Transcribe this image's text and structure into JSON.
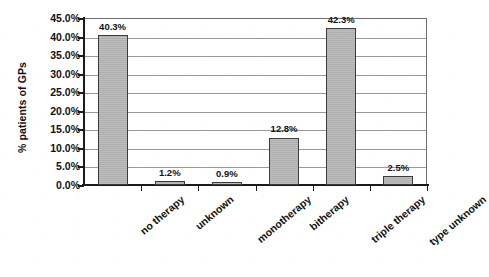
{
  "chart_data": {
    "type": "bar",
    "title": "",
    "xlabel": "",
    "ylabel": "% patients of GPs",
    "ylim": [
      0,
      45
    ],
    "ytick_step": 5,
    "grid": "horizontal",
    "legend": "none",
    "categories": [
      "no therapy",
      "unknown",
      "monotherapy",
      "bitherapy",
      "triple therapy",
      "type unknown"
    ],
    "values": [
      40.3,
      1.2,
      0.9,
      12.8,
      42.3,
      2.5
    ],
    "value_labels": [
      "40.3%",
      "1.2%",
      "0.9%",
      "12.8%",
      "42.3%",
      "2.5%"
    ],
    "ytick_labels": [
      "45.0%",
      "40.0%",
      "35.0%",
      "30.0%",
      "25.0%",
      "20.0%",
      "15.0%",
      "10.0%",
      "5.0%",
      "0.0%"
    ],
    "ytick_values": [
      45,
      40,
      35,
      30,
      25,
      20,
      15,
      10,
      5,
      0
    ],
    "series": [
      {
        "name": "% patients of GPs",
        "values": [
          40.3,
          1.2,
          0.9,
          12.8,
          42.3,
          2.5
        ],
        "color": "#b4b4b4",
        "border_color": "#3c3c3c"
      }
    ]
  },
  "axes": {
    "y_title": "% patients of GPs",
    "ticks": [
      {
        "label": "45.0%"
      },
      {
        "label": "40.0%"
      },
      {
        "label": "35.0%"
      },
      {
        "label": "30.0%"
      },
      {
        "label": "25.0%"
      },
      {
        "label": "20.0%"
      },
      {
        "label": "15.0%"
      },
      {
        "label": "10.0%"
      },
      {
        "label": "5.0%"
      },
      {
        "label": "0.0%"
      }
    ]
  },
  "bars": [
    {
      "category": "no therapy",
      "value_label": "40.3%"
    },
    {
      "category": "unknown",
      "value_label": "1.2%"
    },
    {
      "category": "monotherapy",
      "value_label": "0.9%"
    },
    {
      "category": "bitherapy",
      "value_label": "12.8%"
    },
    {
      "category": "triple therapy",
      "value_label": "42.3%"
    },
    {
      "category": "type unknown",
      "value_label": "2.5%"
    }
  ],
  "colors": {
    "bar_fill": "#b4b4b4",
    "bar_border": "#3c3c3c",
    "gridline": "#9a9a9a",
    "axis": "#1b1b1b",
    "text": "#111111",
    "background": "#ffffff"
  }
}
